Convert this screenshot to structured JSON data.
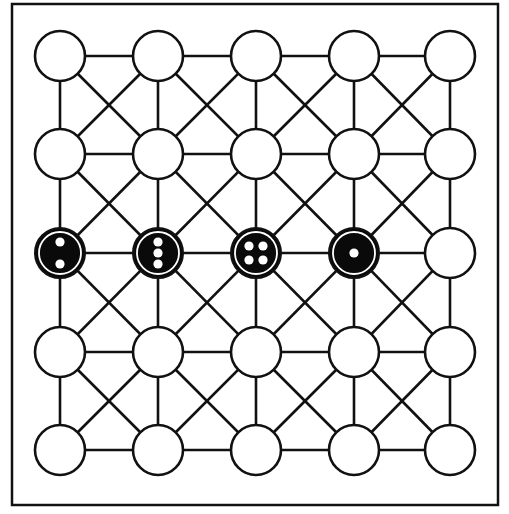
{
  "board": {
    "type": "5x5 alquerque-style board with diagonals in every cell",
    "rows": 5,
    "cols": 5,
    "frame": {
      "x": 12,
      "y": 4,
      "width": 486,
      "height": 501
    },
    "col_x": [
      60,
      158,
      256,
      354,
      450
    ],
    "row_y": [
      56,
      154,
      253,
      352,
      450
    ],
    "node_radius": 25,
    "colors": {
      "line": "#111111",
      "empty_node_fill": "#ffffff",
      "piece_fill": "#0a0a0a",
      "pip_fill": "#ffffff",
      "background": "#ffffff"
    },
    "pieces": [
      {
        "row": 2,
        "col": 0,
        "color": "black",
        "pips": 2,
        "pip_layout": "vertical"
      },
      {
        "row": 2,
        "col": 1,
        "color": "black",
        "pips": 3,
        "pip_layout": "vertical"
      },
      {
        "row": 2,
        "col": 2,
        "color": "black",
        "pips": 4,
        "pip_layout": "square"
      },
      {
        "row": 2,
        "col": 3,
        "color": "black",
        "pips": 1,
        "pip_layout": "center"
      }
    ]
  }
}
